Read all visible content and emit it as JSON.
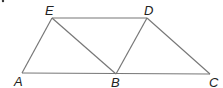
{
  "diagram": {
    "points": {
      "A": {
        "label": "A",
        "x": 22,
        "y": 73
      },
      "B": {
        "label": "B",
        "x": 116,
        "y": 74
      },
      "C": {
        "label": "C",
        "x": 210,
        "y": 74
      },
      "D": {
        "label": "D",
        "x": 147,
        "y": 18
      },
      "E": {
        "label": "E",
        "x": 52,
        "y": 18
      }
    },
    "segments": [
      "AB",
      "BC",
      "AE",
      "ED",
      "DC",
      "EB",
      "BD"
    ]
  }
}
